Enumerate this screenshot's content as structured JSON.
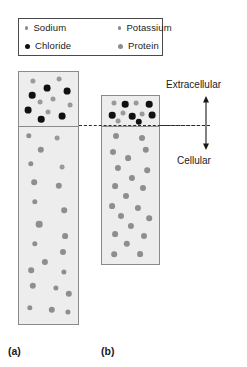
{
  "legend": {
    "items": [
      {
        "label": "Sodium",
        "marker": "small-gray-dot",
        "color": "#8c8c8c"
      },
      {
        "label": "Chloride",
        "marker": "black-dot",
        "color": "#111111"
      },
      {
        "label": "Potassium",
        "marker": "small-gray-dot",
        "color": "#8c8c8c"
      },
      {
        "label": "Protein",
        "marker": "medium-gray-dot",
        "color": "#8e8e8e"
      }
    ]
  },
  "annotations": {
    "extracellular": "Extracellular",
    "cellular": "Cellular",
    "arrow": "double-headed-vertical-arrow"
  },
  "captions": {
    "panel_a": "(a)",
    "panel_b": "(b)"
  },
  "chart_data": {
    "type": "scatter",
    "title": "",
    "xlabel": "",
    "ylabel": "",
    "membrane_y": 125,
    "panels": [
      {
        "name": "a",
        "caption": "(a)",
        "x": 18,
        "y": 71,
        "width": 61,
        "height": 254,
        "membrane_offset": 54,
        "extracellular_particles": [
          {
            "species": "Sodium",
            "x": 14,
            "y": 9,
            "r": 2.6
          },
          {
            "species": "Sodium",
            "x": 40,
            "y": 7,
            "r": 2.4
          },
          {
            "species": "Chloride",
            "x": 28,
            "y": 16,
            "r": 3.4
          },
          {
            "species": "Chloride",
            "x": 48,
            "y": 19,
            "r": 3.4
          },
          {
            "species": "Chloride",
            "x": 13,
            "y": 23,
            "r": 3.3
          },
          {
            "species": "Sodium",
            "x": 34,
            "y": 27,
            "r": 2.5
          },
          {
            "species": "Sodium",
            "x": 21,
            "y": 30,
            "r": 2.4
          },
          {
            "species": "Chloride",
            "x": 9,
            "y": 38,
            "r": 3.4
          },
          {
            "species": "Sodium",
            "x": 29,
            "y": 40,
            "r": 2.5
          },
          {
            "species": "Chloride",
            "x": 43,
            "y": 44,
            "r": 3.4
          },
          {
            "species": "Chloride",
            "x": 22,
            "y": 47,
            "r": 3.3
          },
          {
            "species": "Sodium",
            "x": 51,
            "y": 33,
            "r": 2.4
          }
        ],
        "cellular_particles": [
          {
            "species": "Protein",
            "x": 10,
            "y": 64,
            "r": 2.7
          },
          {
            "species": "Potassium",
            "x": 38,
            "y": 66,
            "r": 2.4
          },
          {
            "species": "Protein",
            "x": 22,
            "y": 78,
            "r": 3.2
          },
          {
            "species": "Protein",
            "x": 12,
            "y": 92,
            "r": 2.7
          },
          {
            "species": "Potassium",
            "x": 43,
            "y": 95,
            "r": 2.4
          },
          {
            "species": "Protein",
            "x": 15,
            "y": 110,
            "r": 2.8
          },
          {
            "species": "Protein",
            "x": 40,
            "y": 114,
            "r": 3.2
          },
          {
            "species": "Protein",
            "x": 16,
            "y": 130,
            "r": 2.7
          },
          {
            "species": "Protein",
            "x": 45,
            "y": 138,
            "r": 2.8
          },
          {
            "species": "Protein",
            "x": 20,
            "y": 152,
            "r": 3.3
          },
          {
            "species": "Protein",
            "x": 46,
            "y": 164,
            "r": 2.9
          },
          {
            "species": "Protein",
            "x": 16,
            "y": 172,
            "r": 2.7
          },
          {
            "species": "Protein",
            "x": 44,
            "y": 180,
            "r": 3.0
          },
          {
            "species": "Protein",
            "x": 26,
            "y": 190,
            "r": 3.1
          },
          {
            "species": "Protein",
            "x": 12,
            "y": 198,
            "r": 2.8
          },
          {
            "species": "Protein",
            "x": 45,
            "y": 200,
            "r": 2.6
          },
          {
            "species": "Protein",
            "x": 14,
            "y": 214,
            "r": 3.2
          },
          {
            "species": "Protein",
            "x": 37,
            "y": 216,
            "r": 2.6
          },
          {
            "species": "Protein",
            "x": 50,
            "y": 222,
            "r": 3.2
          },
          {
            "species": "Protein",
            "x": 11,
            "y": 236,
            "r": 2.7
          },
          {
            "species": "Protein",
            "x": 33,
            "y": 238,
            "r": 3.2
          },
          {
            "species": "Protein",
            "x": 49,
            "y": 240,
            "r": 2.6
          }
        ]
      },
      {
        "name": "b",
        "caption": "(b)",
        "x": 101,
        "y": 95,
        "width": 59,
        "height": 170,
        "membrane_offset": 30,
        "extracellular_particles": [
          {
            "species": "Sodium",
            "x": 12,
            "y": 7,
            "r": 2.5
          },
          {
            "species": "Chloride",
            "x": 23,
            "y": 8,
            "r": 3.3
          },
          {
            "species": "Sodium",
            "x": 34,
            "y": 7,
            "r": 2.4
          },
          {
            "species": "Chloride",
            "x": 47,
            "y": 8,
            "r": 3.3
          },
          {
            "species": "Chloride",
            "x": 10,
            "y": 19,
            "r": 3.3
          },
          {
            "species": "Sodium",
            "x": 21,
            "y": 17,
            "r": 2.5
          },
          {
            "species": "Chloride",
            "x": 30,
            "y": 20,
            "r": 3.3
          },
          {
            "species": "Sodium",
            "x": 40,
            "y": 18,
            "r": 2.4
          },
          {
            "species": "Chloride",
            "x": 50,
            "y": 19,
            "r": 3.4
          },
          {
            "species": "Sodium",
            "x": 16,
            "y": 25,
            "r": 2.4
          },
          {
            "species": "Chloride",
            "x": 37,
            "y": 26,
            "r": 3.2
          }
        ],
        "cellular_particles": [
          {
            "species": "Protein",
            "x": 14,
            "y": 40,
            "r": 3.0
          },
          {
            "species": "Protein",
            "x": 40,
            "y": 42,
            "r": 3.0
          },
          {
            "species": "Protein",
            "x": 11,
            "y": 56,
            "r": 3.0
          },
          {
            "species": "Protein",
            "x": 44,
            "y": 54,
            "r": 3.2
          },
          {
            "species": "Protein",
            "x": 26,
            "y": 62,
            "r": 2.9
          },
          {
            "species": "Protein",
            "x": 16,
            "y": 72,
            "r": 3.1
          },
          {
            "species": "Protein",
            "x": 45,
            "y": 74,
            "r": 2.8
          },
          {
            "species": "Protein",
            "x": 30,
            "y": 82,
            "r": 3.1
          },
          {
            "species": "Protein",
            "x": 13,
            "y": 90,
            "r": 2.9
          },
          {
            "species": "Protein",
            "x": 41,
            "y": 92,
            "r": 3.0
          },
          {
            "species": "Protein",
            "x": 24,
            "y": 100,
            "r": 3.0
          },
          {
            "species": "Protein",
            "x": 10,
            "y": 110,
            "r": 2.9
          },
          {
            "species": "Protein",
            "x": 36,
            "y": 112,
            "r": 3.1
          },
          {
            "species": "Protein",
            "x": 19,
            "y": 120,
            "r": 3.0
          },
          {
            "species": "Protein",
            "x": 47,
            "y": 122,
            "r": 2.8
          },
          {
            "species": "Protein",
            "x": 29,
            "y": 130,
            "r": 3.1
          },
          {
            "species": "Protein",
            "x": 13,
            "y": 138,
            "r": 2.9
          },
          {
            "species": "Protein",
            "x": 42,
            "y": 140,
            "r": 3.0
          },
          {
            "species": "Protein",
            "x": 25,
            "y": 148,
            "r": 3.2
          },
          {
            "species": "Protein",
            "x": 12,
            "y": 158,
            "r": 2.8
          },
          {
            "species": "Protein",
            "x": 38,
            "y": 158,
            "r": 2.9
          }
        ]
      }
    ]
  }
}
